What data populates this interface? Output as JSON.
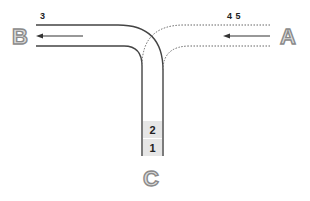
{
  "diagram": {
    "type": "railway-junction",
    "stations": {
      "A": {
        "label": "A",
        "position": "right"
      },
      "B": {
        "label": "B",
        "position": "left"
      },
      "C": {
        "label": "C",
        "position": "bottom"
      }
    },
    "track_labels": {
      "B_track": "3",
      "A_track": "4 5"
    },
    "siding_cars": [
      {
        "label": "2"
      },
      {
        "label": "1"
      }
    ],
    "arrows": [
      {
        "track": "B",
        "direction": "left"
      },
      {
        "track": "A",
        "direction": "left"
      }
    ],
    "colors": {
      "track": "#444444",
      "dotted_track": "#666666",
      "station_fill": "#dddddd",
      "station_stroke": "#8a8a8a",
      "car_fill": "#e6e6e6"
    }
  }
}
